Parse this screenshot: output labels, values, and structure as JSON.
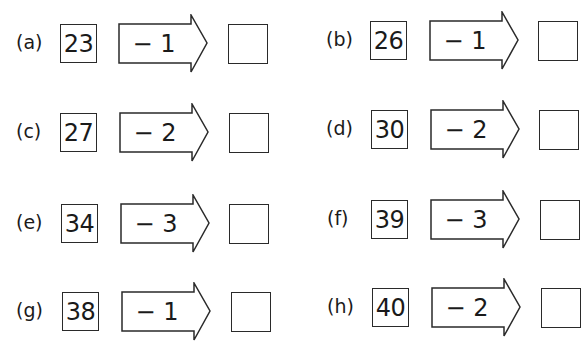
{
  "worksheet": {
    "problems": [
      {
        "label": "(a)",
        "start": "23",
        "operation": "− 1",
        "answer": ""
      },
      {
        "label": "(b)",
        "start": "26",
        "operation": "− 1",
        "answer": ""
      },
      {
        "label": "(c)",
        "start": "27",
        "operation": "− 2",
        "answer": ""
      },
      {
        "label": "(d)",
        "start": "30",
        "operation": "− 2",
        "answer": ""
      },
      {
        "label": "(e)",
        "start": "34",
        "operation": "− 3",
        "answer": ""
      },
      {
        "label": "(f)",
        "start": "39",
        "operation": "− 3",
        "answer": ""
      },
      {
        "label": "(g)",
        "start": "38",
        "operation": "− 1",
        "answer": ""
      },
      {
        "label": "(h)",
        "start": "40",
        "operation": "− 2",
        "answer": ""
      }
    ]
  }
}
